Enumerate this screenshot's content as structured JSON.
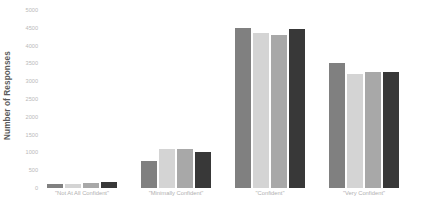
{
  "chart_data": {
    "type": "bar",
    "title": "",
    "subtitle": "",
    "xlabel": "",
    "ylabel": "Number of Responses",
    "categories": [
      "\"Not At All Confident\"",
      "\"Minimally Confident\"",
      "\"Confident\"",
      "\"Very Confident\""
    ],
    "series": [
      {
        "name": "Series 1",
        "color": "#808080",
        "values": [
          100,
          750,
          4500,
          3500
        ]
      },
      {
        "name": "Series 2",
        "color": "#d4d4d4",
        "values": [
          120,
          1100,
          4350,
          3200
        ]
      },
      {
        "name": "Series 3",
        "color": "#a8a8a8",
        "values": [
          130,
          1100,
          4300,
          3250
        ]
      },
      {
        "name": "Series 4",
        "color": "#383838",
        "values": [
          170,
          1000,
          4480,
          3250
        ]
      }
    ],
    "ylim": [
      0,
      5000
    ],
    "ytick_values": [
      0,
      500,
      1000,
      1500,
      2000,
      2500,
      3000,
      3500,
      4000,
      4500,
      5000
    ],
    "ytick_labels": [
      "0",
      "500",
      "1000",
      "1500",
      "2000",
      "2500",
      "3000",
      "3500",
      "4000",
      "4500",
      "5000"
    ],
    "grid": false,
    "legend": "none",
    "axis_label_color": "#b9b9b9",
    "ylabel_color": "#5a5a5a",
    "background_color": "#ffffff"
  }
}
